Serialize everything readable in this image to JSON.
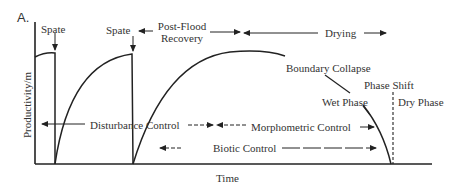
{
  "figure": {
    "panel_label": "A.",
    "x_axis_label": "Time",
    "y_axis_label": "Productivity/m",
    "events": {
      "spate_1": "Spate",
      "spate_2": "Spate",
      "post_flood_recovery_line1": "Post-Flood",
      "post_flood_recovery_line2": "Recovery",
      "drying": "Drying",
      "boundary_collapse": "Boundary Collapse",
      "phase_shift": "Phase Shift",
      "wet_phase": "Wet Phase",
      "dry_phase": "Dry Phase"
    },
    "controls": {
      "disturbance": "Disturbance Control",
      "morphometric": "Morphometric Control",
      "biotic": "Biotic Control"
    }
  }
}
